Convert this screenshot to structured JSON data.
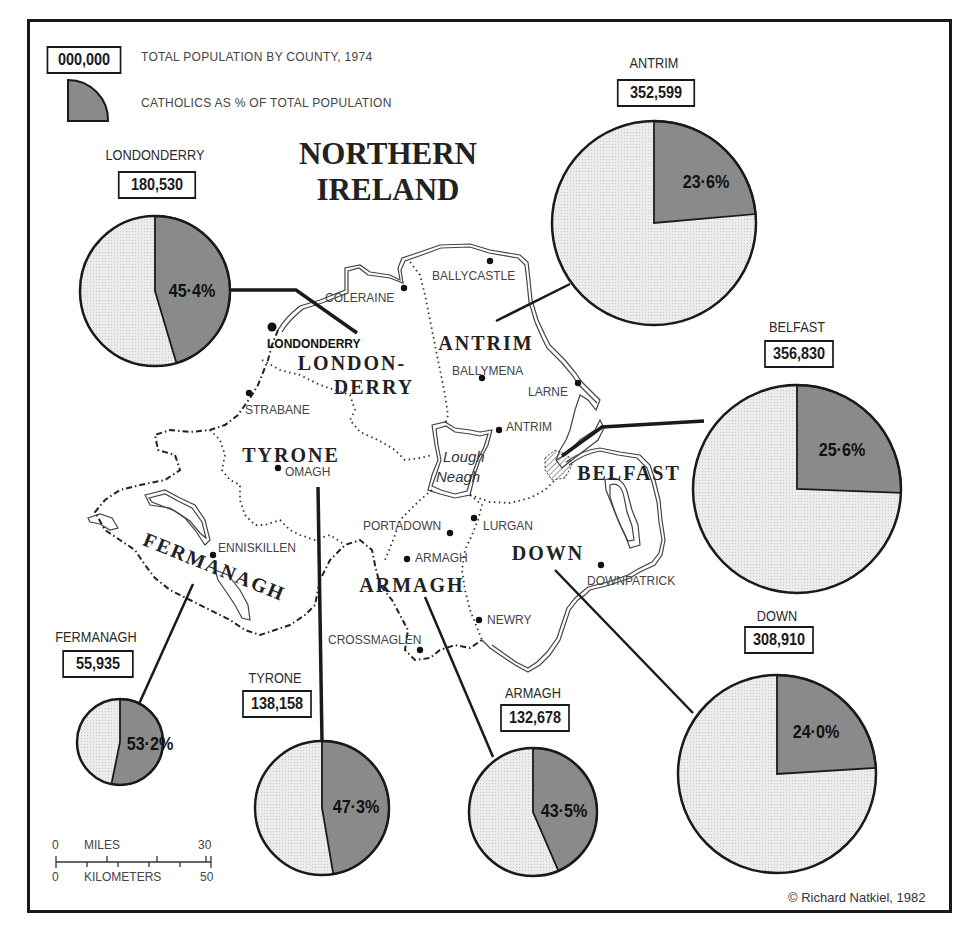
{
  "title": {
    "line1": "NORTHERN",
    "line2": "IRELAND"
  },
  "legend": {
    "box_sample": "000,000",
    "box_label": "TOTAL POPULATION BY COUNTY, 1974",
    "wedge_label": "CATHOLICS AS % OF TOTAL POPULATION"
  },
  "colors": {
    "catholic": "#8a8a8a",
    "other": "#e9e9e9",
    "ink": "#1a1a1a"
  },
  "chart_data": {
    "type": "pie",
    "series": [
      {
        "name": "Londonderry",
        "population": 180530,
        "catholic_pct": 45.4
      },
      {
        "name": "Antrim",
        "population": 352599,
        "catholic_pct": 23.6
      },
      {
        "name": "Belfast",
        "population": 356830,
        "catholic_pct": 25.6
      },
      {
        "name": "Down",
        "population": 308910,
        "catholic_pct": 24.0
      },
      {
        "name": "Armagh",
        "population": 132678,
        "catholic_pct": 43.5
      },
      {
        "name": "Tyrone",
        "population": 138158,
        "catholic_pct": 47.3
      },
      {
        "name": "Fermanagh",
        "population": 55935,
        "catholic_pct": 53.2
      }
    ]
  },
  "pies": [
    {
      "name": "LONDONDERRY",
      "pop": "180,530",
      "pct_label": "45·4%",
      "pct": 45.4,
      "cx": 155,
      "cy": 291,
      "r": 75,
      "name_x": 155,
      "name_y": 155,
      "box_y": 183,
      "box_w": 88,
      "pct_x": 192,
      "pct_y": 290
    },
    {
      "name": "ANTRIM",
      "pop": "352,599",
      "pct_label": "23·6%",
      "pct": 23.6,
      "cx": 654,
      "cy": 223,
      "r": 102,
      "name_x": 654,
      "name_y": 63,
      "box_y": 91,
      "box_w": 88,
      "pct_x": 706,
      "pct_y": 181
    },
    {
      "name": "BELFAST",
      "pop": "356,830",
      "pct_label": "25·6%",
      "pct": 25.6,
      "cx": 797,
      "cy": 489,
      "r": 104,
      "name_x": 797,
      "name_y": 327,
      "box_y": 352,
      "box_w": 78,
      "pct_x": 842,
      "pct_y": 449
    },
    {
      "name": "DOWN",
      "pop": "308,910",
      "pct_label": "24·0%",
      "pct": 24.0,
      "cx": 777,
      "cy": 774,
      "r": 99,
      "name_x": 777,
      "name_y": 616,
      "box_y": 638,
      "box_w": 78,
      "pct_x": 816,
      "pct_y": 731
    },
    {
      "name": "ARMAGH",
      "pop": "132,678",
      "pct_label": "43·5%",
      "pct": 43.5,
      "cx": 533,
      "cy": 812,
      "r": 64,
      "name_x": 533,
      "name_y": 693,
      "box_y": 716,
      "box_w": 78,
      "pct_x": 564,
      "pct_y": 810
    },
    {
      "name": "TYRONE",
      "pop": "138,158",
      "pct_label": "47·3%",
      "pct": 47.3,
      "cx": 322,
      "cy": 808,
      "r": 67,
      "name_x": 275,
      "name_y": 678,
      "box_y": 702,
      "box_w": 78,
      "pct_x": 356,
      "pct_y": 806
    },
    {
      "name": "FERMANAGH",
      "pop": "55,935",
      "pct_label": "53·2%",
      "pct": 53.2,
      "cx": 120,
      "cy": 742,
      "r": 43,
      "name_x": 96,
      "name_y": 637,
      "box_y": 662,
      "box_w": 80,
      "pct_x": 150,
      "pct_y": 743
    }
  ],
  "leaders": [
    {
      "x1": 230,
      "y1": 290,
      "x2": 296,
      "y2": 290,
      "x3": 357,
      "y3": 333
    },
    {
      "x1": 570,
      "y1": 284,
      "x2": 496,
      "y2": 321
    },
    {
      "x1": 704,
      "y1": 421,
      "x2": 602,
      "y2": 427,
      "x3": 562,
      "y3": 456
    },
    {
      "x1": 693,
      "y1": 713,
      "x2": 555,
      "y2": 570
    },
    {
      "x1": 493,
      "y1": 757,
      "x2": 425,
      "y2": 597
    },
    {
      "x1": 322,
      "y1": 741,
      "x2": 318,
      "y2": 487
    },
    {
      "x1": 139,
      "y1": 704,
      "x2": 193,
      "y2": 584
    }
  ],
  "counties_on_map": [
    {
      "label": "LONDON-",
      "x": 352,
      "y": 362
    },
    {
      "label": "DERRY",
      "x": 374,
      "y": 386
    },
    {
      "label": "ANTRIM",
      "x": 486,
      "y": 342
    },
    {
      "label": "TYRONE",
      "x": 291,
      "y": 454
    },
    {
      "label": "BELFAST",
      "x": 629,
      "y": 472
    },
    {
      "label": "DOWN",
      "x": 548,
      "y": 552
    },
    {
      "label": "ARMAGH",
      "x": 412,
      "y": 584
    }
  ],
  "fermanagh_label": {
    "label": "FERMANAGH",
    "x": 212,
    "y": 573,
    "rotate": 22
  },
  "towns": [
    {
      "name": "BALLYCASTLE",
      "dot_x": 490,
      "dot_y": 261,
      "tx": 432,
      "ty": 276
    },
    {
      "name": "COLERAINE",
      "dot_x": 404,
      "dot_y": 288,
      "tx": 325,
      "ty": 298
    },
    {
      "name": "LONDONDERRY",
      "dot_x": 272,
      "dot_y": 327,
      "tx": 267,
      "ty": 344,
      "bold": true
    },
    {
      "name": "BALLYMENA",
      "dot_x": 482,
      "dot_y": 378,
      "tx": 452,
      "ty": 371
    },
    {
      "name": "LARNE",
      "dot_x": 578,
      "dot_y": 383,
      "tx": 528,
      "ty": 392
    },
    {
      "name": "STRABANE",
      "dot_x": 249,
      "dot_y": 393,
      "tx": 245,
      "ty": 410
    },
    {
      "name": "ANTRIM",
      "dot_x": 499,
      "dot_y": 430,
      "tx": 506,
      "ty": 427
    },
    {
      "name": "OMAGH",
      "dot_x": 278,
      "dot_y": 468,
      "tx": 285,
      "ty": 472
    },
    {
      "name": "ENNISKILLEN",
      "dot_x": 213,
      "dot_y": 555,
      "tx": 218,
      "ty": 548
    },
    {
      "name": "PORTADOWN",
      "dot_x": 450,
      "dot_y": 533,
      "tx": 363,
      "ty": 526
    },
    {
      "name": "LURGAN",
      "dot_x": 474,
      "dot_y": 518,
      "tx": 483,
      "ty": 526
    },
    {
      "name": "ARMAGH",
      "dot_x": 407,
      "dot_y": 559,
      "tx": 415,
      "ty": 558
    },
    {
      "name": "DOWNPATRICK",
      "dot_x": 601,
      "dot_y": 565,
      "tx": 587,
      "ty": 581
    },
    {
      "name": "NEWRY",
      "dot_x": 479,
      "dot_y": 620,
      "tx": 487,
      "ty": 620
    },
    {
      "name": "CROSSMAGLEN",
      "dot_x": 420,
      "dot_y": 650,
      "tx": 328,
      "ty": 640
    }
  ],
  "lough": {
    "line1": "Lough",
    "line2": "Neagh"
  },
  "scale": {
    "miles_label": "MILES",
    "miles_zero": "0",
    "miles_max": "30",
    "km_label": "KILOMETERS",
    "km_zero": "0",
    "km_max": "50"
  },
  "credit": "© Richard Natkiel, 1982"
}
